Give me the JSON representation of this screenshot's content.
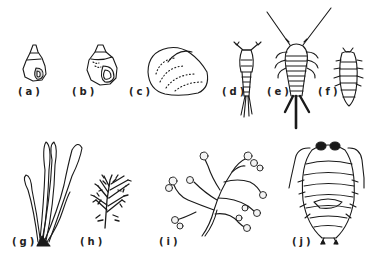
{
  "figure": {
    "panels": [
      {
        "id": "a",
        "label": "(a)",
        "subject": "small conical snail shell"
      },
      {
        "id": "b",
        "label": "(b)",
        "subject": "round snail shell"
      },
      {
        "id": "c",
        "label": "(c)",
        "subject": "bivalve clam shell"
      },
      {
        "id": "d",
        "label": "(d)",
        "subject": "copepod"
      },
      {
        "id": "e",
        "label": "(e)",
        "subject": "crustacean with long antennae and forked tail"
      },
      {
        "id": "f",
        "label": "(f)",
        "subject": "small isopod"
      },
      {
        "id": "g",
        "label": "(g)",
        "subject": "finger-like seaweed"
      },
      {
        "id": "h",
        "label": "(h)",
        "subject": "bushy branched seaweed"
      },
      {
        "id": "i",
        "label": "(i)",
        "subject": "branched hydroid colony"
      },
      {
        "id": "j",
        "label": "(j)",
        "subject": "large isopod"
      }
    ]
  },
  "colors": {
    "ink": "#1a1a1a",
    "background": "#ffffff"
  }
}
